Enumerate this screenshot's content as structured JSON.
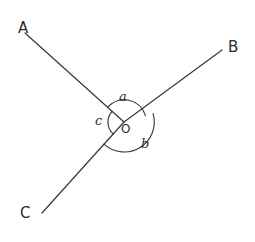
{
  "figure": {
    "type": "geometry-angle-diagram",
    "background_color": "#ffffff",
    "stroke_color": "#3a3a3a",
    "text_color": "#2e2e2e",
    "width": 255,
    "height": 242
  },
  "points": {
    "vertex": {
      "label": "O",
      "x": 124,
      "y": 122
    },
    "a_end": {
      "label": "A",
      "x": 25,
      "y": 33
    },
    "b_end": {
      "label": "B",
      "x": 222,
      "y": 50
    },
    "c_end": {
      "label": "C",
      "x": 42,
      "y": 213
    }
  },
  "point_labels": {
    "A": {
      "text": "A",
      "x": 18,
      "y": 21
    },
    "B": {
      "text": "B",
      "x": 228,
      "y": 40
    },
    "C": {
      "text": "C",
      "x": 20,
      "y": 206
    }
  },
  "rays": [
    {
      "name": "ray-OA",
      "from": "O",
      "to": "A"
    },
    {
      "name": "ray-OB",
      "from": "O",
      "to": "B"
    },
    {
      "name": "ray-OC",
      "from": "O",
      "to": "C"
    }
  ],
  "angles": [
    {
      "id": "a",
      "label": "a",
      "between": [
        "OA",
        "OB"
      ],
      "arc_radius": 22,
      "label_x": 119,
      "label_y": 90
    },
    {
      "id": "b",
      "label": "b",
      "between": [
        "OB",
        "OC"
      ],
      "arc_radius": 30,
      "label_x": 141,
      "label_y": 137
    },
    {
      "id": "c",
      "label": "c",
      "between": [
        "OC",
        "OA"
      ],
      "arc_radius": 16,
      "label_x": 95,
      "label_y": 114
    }
  ],
  "vertex_label": {
    "text": "O",
    "x": 121,
    "y": 123
  }
}
